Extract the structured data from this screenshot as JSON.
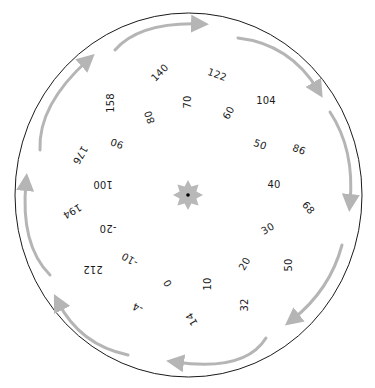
{
  "dial": {
    "title": "Celsius-Fahrenheit conversion dial",
    "center_icon": "star-icon",
    "outline_color": "#1a1a1a",
    "arrow_color": "#b5b5b5",
    "star_color": "#b8b8b8"
  },
  "celsius_labels": [
    {
      "text": "-20",
      "x": 108,
      "y": 228,
      "rot": 180
    },
    {
      "text": "-10",
      "x": 130,
      "y": 259,
      "rot": 210
    },
    {
      "text": "0",
      "x": 168,
      "y": 283,
      "rot": 240
    },
    {
      "text": "10",
      "x": 208,
      "y": 284,
      "rot": 270
    },
    {
      "text": "20",
      "x": 245,
      "y": 264,
      "rot": 300
    },
    {
      "text": "30",
      "x": 268,
      "y": 229,
      "rot": 330
    },
    {
      "text": "40",
      "x": 274,
      "y": 185,
      "rot": 0
    },
    {
      "text": "50",
      "x": 260,
      "y": 145,
      "rot": 20
    },
    {
      "text": "60",
      "x": 229,
      "y": 113,
      "rot": 300
    },
    {
      "text": "70",
      "x": 188,
      "y": 102,
      "rot": 270
    },
    {
      "text": "80",
      "x": 150,
      "y": 117,
      "rot": 250
    },
    {
      "text": "90",
      "x": 117,
      "y": 143,
      "rot": 200
    },
    {
      "text": "100",
      "x": 103,
      "y": 184,
      "rot": 180
    }
  ],
  "fahrenheit_labels": [
    {
      "text": "194",
      "x": 72,
      "y": 211,
      "rot": 150
    },
    {
      "text": "212",
      "x": 93,
      "y": 269,
      "rot": 180
    },
    {
      "text": "-4",
      "x": 138,
      "y": 307,
      "rot": 200
    },
    {
      "text": "14",
      "x": 192,
      "y": 319,
      "rot": 240
    },
    {
      "text": "32",
      "x": 245,
      "y": 305,
      "rot": 270
    },
    {
      "text": "50",
      "x": 289,
      "y": 265,
      "rot": 270
    },
    {
      "text": "68",
      "x": 308,
      "y": 208,
      "rot": 50
    },
    {
      "text": "86",
      "x": 299,
      "y": 150,
      "rot": 20
    },
    {
      "text": "104",
      "x": 266,
      "y": 101,
      "rot": 0
    },
    {
      "text": "122",
      "x": 217,
      "y": 75,
      "rot": 20
    },
    {
      "text": "140",
      "x": 160,
      "y": 73,
      "rot": 315
    },
    {
      "text": "158",
      "x": 111,
      "y": 103,
      "rot": 270
    },
    {
      "text": "176",
      "x": 80,
      "y": 155,
      "rot": 120
    }
  ]
}
